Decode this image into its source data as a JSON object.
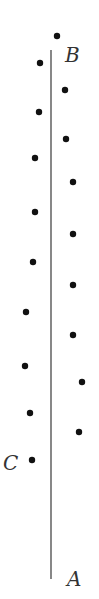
{
  "diagram": {
    "labels": {
      "A": "A",
      "B": "B",
      "C": "C"
    },
    "line": {
      "x": 51,
      "y1": 50,
      "y2": 579,
      "color": "#555555"
    },
    "dot_color": "#111111",
    "dots": [
      {
        "x": 57,
        "y": 36
      },
      {
        "x": 40,
        "y": 63
      },
      {
        "x": 65,
        "y": 90
      },
      {
        "x": 39,
        "y": 112
      },
      {
        "x": 66,
        "y": 139
      },
      {
        "x": 35,
        "y": 158
      },
      {
        "x": 73,
        "y": 182
      },
      {
        "x": 35,
        "y": 212
      },
      {
        "x": 73,
        "y": 234
      },
      {
        "x": 33,
        "y": 262
      },
      {
        "x": 73,
        "y": 285
      },
      {
        "x": 26,
        "y": 312
      },
      {
        "x": 73,
        "y": 335
      },
      {
        "x": 25,
        "y": 366
      },
      {
        "x": 82,
        "y": 382
      },
      {
        "x": 30,
        "y": 413
      },
      {
        "x": 79,
        "y": 432
      },
      {
        "x": 32,
        "y": 460
      }
    ]
  }
}
